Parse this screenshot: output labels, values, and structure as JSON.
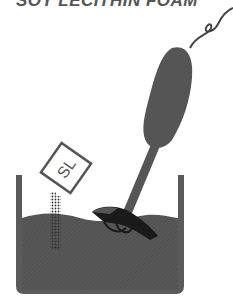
{
  "title": "SOY LECITHIN FOAM",
  "packet": {
    "label": "SL"
  },
  "colors": {
    "container": "#5a5a5a",
    "liquid": "#555555",
    "blender": "#555555",
    "blade": "#1a1a1a",
    "cord": "#444444",
    "packet_border": "#555555",
    "powder_dots": "#333333",
    "title": "#555555"
  }
}
